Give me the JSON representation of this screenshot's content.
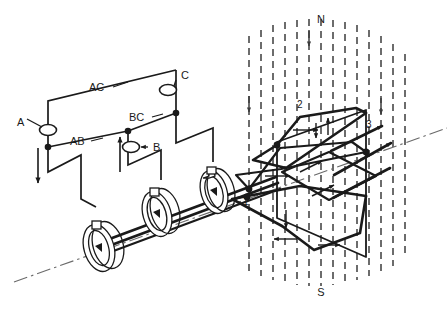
{
  "diagram": {
    "background_color": "#ffffff",
    "line_color": "#1a1a1a",
    "field_line_color": "#3c3c3c"
  },
  "poles": {
    "north_label": "N",
    "south_label": "S",
    "field_direction": "downward"
  },
  "phase_terminals": [
    {
      "id": "A",
      "label": "A",
      "x": 22,
      "y": 122
    },
    {
      "id": "B",
      "label": "B",
      "x": 131,
      "y": 148
    },
    {
      "id": "C",
      "label": "C",
      "x": 179,
      "y": 80
    }
  ],
  "phase_pairs": [
    {
      "id": "AC",
      "label": "AC",
      "x": 96,
      "y": 89
    },
    {
      "id": "AB",
      "label": "AB",
      "x": 79,
      "y": 141
    },
    {
      "id": "BC",
      "label": "BC",
      "x": 136,
      "y": 118
    }
  ],
  "coils": [
    {
      "id": "coil-1",
      "label": "1"
    },
    {
      "id": "coil-2",
      "label": "2"
    },
    {
      "id": "coil-3",
      "label": "3"
    }
  ],
  "slip_rings": [
    {
      "id": "slip-ring-1"
    },
    {
      "id": "slip-ring-2"
    },
    {
      "id": "slip-ring-3"
    }
  ],
  "current_arrows": [
    {
      "id": "arrow-a-down",
      "direction": "down"
    },
    {
      "id": "arrow-b-up",
      "direction": "up"
    }
  ],
  "icons": {
    "terminal": "terminal-ellipse-icon",
    "junction": "junction-dot-icon",
    "shaft_axis": "shaft-axis-dashdot-icon",
    "field_line": "field-line-dashed-icon"
  }
}
